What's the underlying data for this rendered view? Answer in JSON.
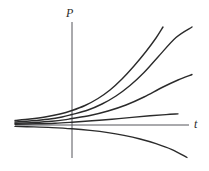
{
  "figure": {
    "kind": "solution-curve-family",
    "background_color": "#ffffff",
    "stroke_color": "#2b2b2b",
    "axis_color": "#55555a",
    "width": 209,
    "height": 171
  },
  "axes": {
    "vertical": {
      "label": "P",
      "name": "population-axis",
      "x": 72,
      "y_top": 22,
      "y_bottom": 158
    },
    "horizontal": {
      "label": "t",
      "name": "time-axis",
      "y": 125,
      "x_left": 15,
      "x_right": 189
    }
  },
  "chart_data": {
    "type": "line",
    "title": "",
    "xlabel": "t",
    "ylabel": "P",
    "grid": false,
    "legend": null,
    "axis_origin_px": [
      72,
      125
    ],
    "xlim": [
      15,
      200
    ],
    "ylim": [
      22,
      165
    ],
    "series": [
      {
        "name": "curve-1-steepest",
        "stroke_width": 1.4,
        "points_px": [
          [
            15,
            120.5
          ],
          [
            30,
            119.0
          ],
          [
            45,
            117.0
          ],
          [
            60,
            114.0
          ],
          [
            72,
            110.5
          ],
          [
            85,
            105.5
          ],
          [
            98,
            98.5
          ],
          [
            110,
            90.0
          ],
          [
            122,
            79.0
          ],
          [
            134,
            66.0
          ],
          [
            146,
            51.5
          ],
          [
            156,
            38.0
          ],
          [
            163,
            27.0
          ]
        ]
      },
      {
        "name": "curve-2",
        "stroke_width": 1.4,
        "points_px": [
          [
            15,
            122.0
          ],
          [
            32,
            120.8
          ],
          [
            48,
            119.2
          ],
          [
            62,
            117.0
          ],
          [
            72,
            114.5
          ],
          [
            88,
            110.0
          ],
          [
            102,
            104.0
          ],
          [
            116,
            96.0
          ],
          [
            130,
            85.5
          ],
          [
            144,
            72.5
          ],
          [
            158,
            57.0
          ],
          [
            176,
            37.5
          ],
          [
            192,
            27.0
          ]
        ]
      },
      {
        "name": "curve-3",
        "stroke_width": 1.4,
        "points_px": [
          [
            15,
            123.3
          ],
          [
            34,
            122.5
          ],
          [
            52,
            121.3
          ],
          [
            66,
            119.6
          ],
          [
            72,
            118.5
          ],
          [
            90,
            115.5
          ],
          [
            108,
            111.0
          ],
          [
            126,
            105.0
          ],
          [
            144,
            97.0
          ],
          [
            162,
            87.5
          ],
          [
            178,
            80.0
          ],
          [
            192,
            74.5
          ]
        ]
      },
      {
        "name": "curve-4-shallow",
        "stroke_width": 1.4,
        "points_px": [
          [
            15,
            124.2
          ],
          [
            36,
            123.8
          ],
          [
            55,
            123.2
          ],
          [
            72,
            122.2
          ],
          [
            92,
            120.8
          ],
          [
            112,
            119.2
          ],
          [
            132,
            117.4
          ],
          [
            150,
            115.8
          ],
          [
            166,
            114.6
          ],
          [
            178,
            113.9
          ]
        ]
      },
      {
        "name": "curve-5-decaying",
        "stroke_width": 1.4,
        "points_px": [
          [
            15,
            126.4
          ],
          [
            34,
            126.9
          ],
          [
            52,
            127.6
          ],
          [
            72,
            128.8
          ],
          [
            90,
            130.4
          ],
          [
            108,
            132.6
          ],
          [
            124,
            135.4
          ],
          [
            140,
            139.0
          ],
          [
            156,
            143.6
          ],
          [
            172,
            149.6
          ],
          [
            187,
            157.5
          ]
        ]
      }
    ]
  }
}
